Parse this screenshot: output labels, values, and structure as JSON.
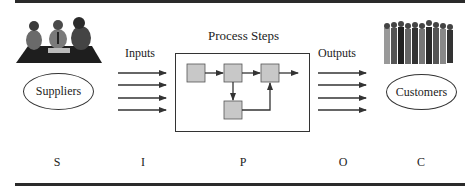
{
  "diagram": {
    "type": "SIPOC process diagram",
    "title": "Process Steps",
    "labels": {
      "inputs": "Inputs",
      "outputs": "Outputs",
      "process_title": "Process Steps"
    },
    "entities": {
      "suppliers": {
        "label": "Suppliers",
        "icon": "meeting-clipart-icon"
      },
      "customers": {
        "label": "Customers",
        "icon": "crowd-clipart-icon"
      }
    },
    "input_arrows": 4,
    "output_arrows": 4,
    "process_steps": [
      {
        "id": 1,
        "row": 1,
        "col": 1
      },
      {
        "id": 2,
        "row": 1,
        "col": 2
      },
      {
        "id": 3,
        "row": 1,
        "col": 3
      },
      {
        "id": 4,
        "row": 2,
        "col": 2
      }
    ],
    "flows": [
      {
        "from": 1,
        "to": 2
      },
      {
        "from": 2,
        "to": 3
      },
      {
        "from": 2,
        "to": 4
      },
      {
        "from": 4,
        "to": 3
      },
      {
        "from": 3,
        "to": "out"
      }
    ],
    "acronym": [
      "S",
      "I",
      "P",
      "O",
      "C"
    ]
  },
  "colors": {
    "step_fill": "#c8c8c8",
    "line": "#333333",
    "rule": "#2a2a2a"
  }
}
